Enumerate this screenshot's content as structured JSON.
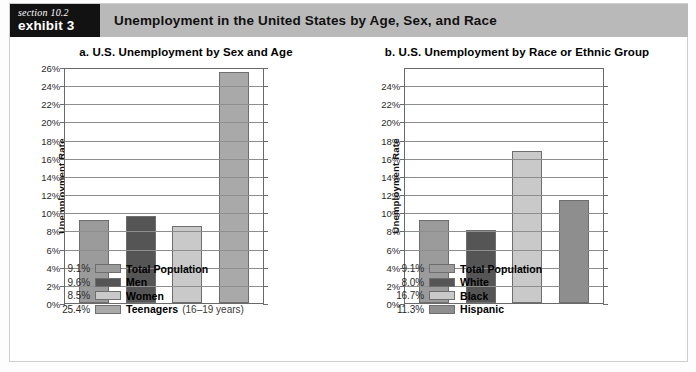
{
  "header": {
    "section_label": "section 10.2",
    "exhibit_label": "exhibit 3",
    "title": "Unemployment in the United States by Age, Sex, and Race",
    "band_color": "#b9b9b9",
    "box_color": "#121212"
  },
  "chart_data": [
    {
      "type": "bar",
      "panel": "a",
      "title": "a. U.S. Unemployment by Sex and Age",
      "xlabel": "",
      "ylabel": "Unemployment Rate",
      "ylim": [
        0,
        26
      ],
      "ytick_step": 2,
      "ytick_labels": [
        "0%",
        "2%",
        "4%",
        "6%",
        "8%",
        "10%",
        "12%",
        "14%",
        "16%",
        "18%",
        "20%",
        "22%",
        "24%",
        "26%"
      ],
      "ytick_values": [
        0,
        2,
        4,
        6,
        8,
        10,
        12,
        14,
        16,
        18,
        20,
        22,
        24,
        26
      ],
      "grid": true,
      "legend_position": "below",
      "categories": [
        "Total Population",
        "Men",
        "Women",
        "Teenagers"
      ],
      "values": [
        9.1,
        9.6,
        8.5,
        25.4
      ],
      "value_labels": [
        "9.1%",
        "9.6%",
        "8.5%",
        "25.4%"
      ],
      "colors": [
        "#9b9b9b",
        "#555555",
        "#c9c9c9",
        "#a9a9a9"
      ],
      "legend": [
        {
          "value": "9.1%",
          "label": "Total Population",
          "note": "",
          "color": "#9b9b9b"
        },
        {
          "value": "9.6%",
          "label": "Men",
          "note": "",
          "color": "#555555"
        },
        {
          "value": "8.5%",
          "label": "Women",
          "note": "",
          "color": "#c9c9c9"
        },
        {
          "value": "25.4%",
          "label": "Teenagers",
          "note": "(16–19 years)",
          "color": "#a9a9a9"
        }
      ]
    },
    {
      "type": "bar",
      "panel": "b",
      "title": "b. U.S. Unemployment by Race or Ethnic Group",
      "xlabel": "",
      "ylabel": "Unemployment Rate",
      "ylim": [
        0,
        26
      ],
      "ytick_step": 2,
      "ytick_labels": [
        "0%",
        "2%",
        "4%",
        "6%",
        "8%",
        "10%",
        "12%",
        "14%",
        "16%",
        "18%",
        "20%",
        "22%",
        "24%"
      ],
      "ytick_values": [
        0,
        2,
        4,
        6,
        8,
        10,
        12,
        14,
        16,
        18,
        20,
        22,
        24
      ],
      "grid": true,
      "legend_position": "below",
      "categories": [
        "Total Population",
        "White",
        "Black",
        "Hispanic"
      ],
      "values": [
        9.1,
        8.0,
        16.7,
        11.3
      ],
      "value_labels": [
        "9.1%",
        "8.0%",
        "16.7%",
        "11.3%"
      ],
      "colors": [
        "#9b9b9b",
        "#555555",
        "#c9c9c9",
        "#8e8e8e"
      ],
      "legend": [
        {
          "value": "9.1%",
          "label": "Total Population",
          "note": "",
          "color": "#9b9b9b"
        },
        {
          "value": "8.0%",
          "label": "White",
          "note": "",
          "color": "#555555"
        },
        {
          "value": "16.7%",
          "label": "Black",
          "note": "",
          "color": "#c9c9c9"
        },
        {
          "value": "11.3%",
          "label": "Hispanic",
          "note": "",
          "color": "#8e8e8e"
        }
      ]
    }
  ]
}
